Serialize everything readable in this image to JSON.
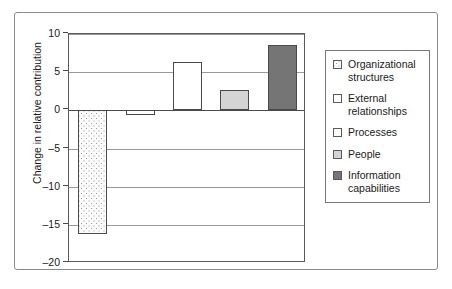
{
  "chart_data": {
    "type": "bar",
    "title": "",
    "xlabel": "",
    "ylabel": "Change in relative contribution",
    "ylim": [
      -20,
      10
    ],
    "yticks": [
      10,
      5,
      0,
      -5,
      -10,
      -15,
      -20
    ],
    "ytick_labels": [
      "10",
      "5",
      "0",
      "–5",
      "–10",
      "–15",
      "–20"
    ],
    "grid": true,
    "legend_position": "right",
    "categories": [
      "Organizational structures",
      "External relationships",
      "Processes",
      "People",
      "Information capabilities"
    ],
    "values": [
      -16.3,
      -0.6,
      6.3,
      2.6,
      8.5
    ],
    "bars": [
      {
        "label": "Organizational structures",
        "value": -16.3,
        "fill": "dotted"
      },
      {
        "label": "External relationships",
        "value": -0.6,
        "fill": "white"
      },
      {
        "label": "Processes",
        "value": 6.3,
        "fill": "white"
      },
      {
        "label": "People",
        "value": 2.6,
        "fill": "lightgray"
      },
      {
        "label": "Information capabilities",
        "value": 8.5,
        "fill": "darkgray"
      }
    ]
  },
  "legend": {
    "items": [
      {
        "label": "Organizational structures",
        "fill": "dotted"
      },
      {
        "label": "External relationships",
        "fill": "white"
      },
      {
        "label": "Processes",
        "fill": "white"
      },
      {
        "label": "People",
        "fill": "lightgray"
      },
      {
        "label": "Information capabilities",
        "fill": "darkgray"
      }
    ]
  },
  "colors": {
    "dotted_bg": "#fbfbfb",
    "dot": "#9a9a9a",
    "white": "#ffffff",
    "lightgray": "#d4d4d4",
    "darkgray": "#757575",
    "bar_border": "#4a4a4a",
    "gridline": "#9a9a9a",
    "zero_line": "#4a4a4a",
    "axis": "#5a5a5a",
    "frame": "#8a8a8a",
    "text": "#1a1a1a"
  }
}
